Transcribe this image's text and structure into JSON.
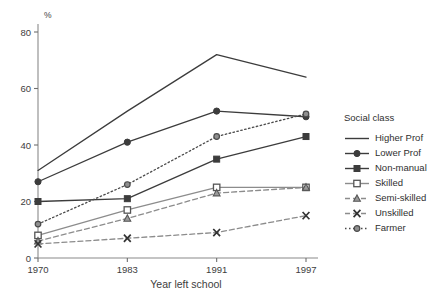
{
  "chart_data": {
    "type": "line",
    "title": "",
    "xlabel": "Year left school",
    "ylabel": "%",
    "categories": [
      "1970",
      "1983",
      "1991",
      "1997"
    ],
    "x_tick_labels": [
      "1970",
      "1983",
      "1991",
      "1997"
    ],
    "y_tick_labels": [
      "0",
      "20",
      "40",
      "60",
      "80"
    ],
    "y_ticks": [
      0,
      20,
      40,
      60,
      80
    ],
    "ylim": [
      0,
      80
    ],
    "grid": false,
    "legend_position": "right",
    "legend_title": "Social class",
    "series": [
      {
        "name": "Higher Prof",
        "values": [
          31,
          52,
          72,
          64
        ],
        "color": "#3c3c3c",
        "dash": "none",
        "marker": "none"
      },
      {
        "name": "Lower Prof",
        "values": [
          27,
          41,
          52,
          50
        ],
        "color": "#3c3c3c",
        "dash": "none",
        "marker": "circle"
      },
      {
        "name": "Non-manual",
        "values": [
          20,
          21,
          35,
          43
        ],
        "color": "#3c3c3c",
        "dash": "none",
        "marker": "square"
      },
      {
        "name": "Skilled",
        "values": [
          8,
          17,
          25,
          25
        ],
        "color": "#8c8c8c",
        "dash": "none",
        "marker": "open-square"
      },
      {
        "name": "Semi-skilled",
        "values": [
          6,
          14,
          23,
          25
        ],
        "color": "#8c8c8c",
        "dash": "dashed",
        "marker": "triangle"
      },
      {
        "name": "Unskilled",
        "values": [
          5,
          7,
          9,
          15
        ],
        "color": "#8c8c8c",
        "dash": "dashed",
        "marker": "cross"
      },
      {
        "name": "Farmer",
        "values": [
          12,
          26,
          43,
          51
        ],
        "color": "#4a4a4a",
        "dash": "dotted",
        "marker": "circle-small"
      }
    ]
  }
}
